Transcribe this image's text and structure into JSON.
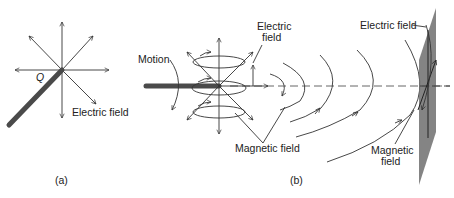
{
  "panels": {
    "a": {
      "caption": "(a)",
      "charge_label": "Q",
      "electric_field_label": "Electric field"
    },
    "b": {
      "caption": "(b)",
      "motion_label": "Motion",
      "electric_field_label_line1": "Electric",
      "electric_field_label_line2": "field",
      "magnetic_field_label": "Magnetic field",
      "plane_electric_field_label": "Electric field",
      "plane_magnetic_field_label_line1": "Magnetic",
      "plane_magnetic_field_label_line2": "field"
    }
  },
  "colors": {
    "rod": "#4a4a4a",
    "plane": "#6e6e6e",
    "lines": "#333333"
  }
}
